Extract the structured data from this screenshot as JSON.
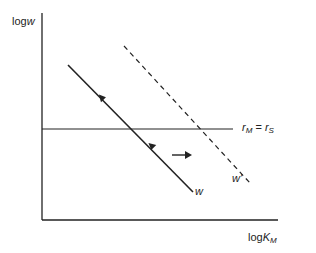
{
  "diagram": {
    "y_axis_label": {
      "prefix": "log",
      "var": "w"
    },
    "x_axis_label": {
      "prefix": "log",
      "var": "K",
      "sub": "M"
    },
    "horizontal_line_label": {
      "lhs": "r",
      "lhs_sub": "M",
      "eq": " = ",
      "rhs": "r",
      "rhs_sub": "S"
    },
    "solid_line_label": "w",
    "dashed_line_label": "w'",
    "colors": {
      "line": "#222222",
      "background": "#ffffff"
    }
  }
}
